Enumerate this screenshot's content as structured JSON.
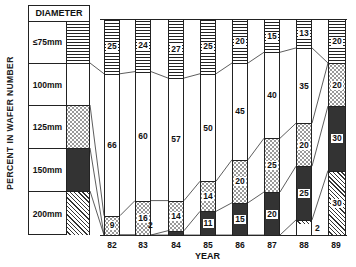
{
  "chart_data": {
    "type": "bar",
    "stacked": true,
    "title": "",
    "xlabel": "YEAR",
    "ylabel": "PERCENT IN WAFER NUMBER",
    "ylim": [
      0,
      100
    ],
    "legend_title": "DIAMETER",
    "legend_position": "left",
    "categories": [
      "82",
      "83",
      "84",
      "85",
      "86",
      "87",
      "88",
      "89"
    ],
    "series": [
      {
        "name": "≤75mm",
        "pattern": "horizontal-lines",
        "values": [
          25,
          24,
          27,
          25,
          20,
          15,
          13,
          20
        ]
      },
      {
        "name": "100mm",
        "pattern": "blank",
        "values": [
          66,
          60,
          57,
          50,
          45,
          40,
          35,
          0
        ]
      },
      {
        "name": "125mm",
        "pattern": "sparse-dots",
        "values": [
          9,
          16,
          14,
          14,
          20,
          25,
          20,
          20
        ]
      },
      {
        "name": "150mm",
        "pattern": "dense-dots",
        "values": [
          0,
          0,
          2,
          11,
          15,
          20,
          25,
          30
        ]
      },
      {
        "name": "200mm",
        "pattern": "diagonal-lines",
        "values": [
          0,
          0,
          0,
          0,
          0,
          0,
          2,
          30
        ]
      }
    ],
    "outside_labels": [
      {
        "text": "2",
        "near": "84",
        "series": "150mm"
      },
      {
        "text": "2",
        "near": "88",
        "series": "200mm"
      }
    ]
  },
  "legend": {
    "title": "DIAMETER",
    "items": [
      {
        "label": "≤75mm",
        "pattern": "p75"
      },
      {
        "label": "100mm",
        "pattern": "p100"
      },
      {
        "label": "125mm",
        "pattern": "p125"
      },
      {
        "label": "150mm",
        "pattern": "p150"
      },
      {
        "label": "200mm",
        "pattern": "p200"
      }
    ]
  },
  "axis": {
    "ylabel": "PERCENT IN WAFER NUMBER",
    "xlabel": "YEAR"
  }
}
